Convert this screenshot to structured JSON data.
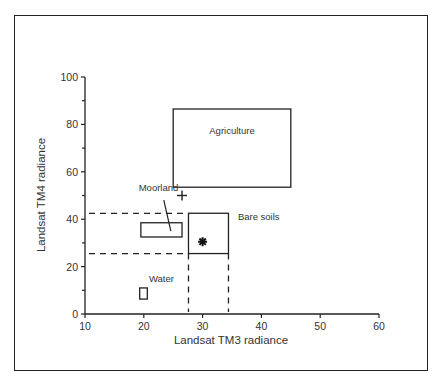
{
  "chart_data": {
    "type": "scatter",
    "title": "",
    "xlabel": "Landsat TM3 radiance",
    "ylabel": "Landsat TM4 radiance",
    "xlim": [
      10,
      60
    ],
    "ylim": [
      0,
      100
    ],
    "x_ticks": [
      10,
      20,
      30,
      40,
      50,
      60
    ],
    "y_ticks": [
      0,
      20,
      40,
      60,
      80,
      100
    ],
    "y_minor_ticks": [
      10,
      30,
      50,
      70,
      90
    ],
    "grid": false,
    "legend": null,
    "regions": [
      {
        "name": "Agriculture",
        "x": [
          25,
          45
        ],
        "y": [
          53.5,
          86.5
        ],
        "label_pos": [
          35,
          76
        ]
      },
      {
        "name": "Moorland",
        "x": [
          19.5,
          26.5
        ],
        "y": [
          32.5,
          38.5
        ],
        "label_pos": [
          22.5,
          52
        ],
        "leader_from": [
          23.4,
          48
        ],
        "leader_to": [
          24.6,
          35
        ]
      },
      {
        "name": "Bare soils",
        "x": [
          27.6,
          34.4
        ],
        "y": [
          25.5,
          42.5
        ],
        "label_pos": [
          36,
          39.5
        ]
      },
      {
        "name": "Water",
        "x": [
          19.3,
          20.6
        ],
        "y": [
          6.3,
          11
        ],
        "label_pos": [
          23,
          13.5
        ]
      }
    ],
    "points": [
      {
        "marker": "plus",
        "x": 26.5,
        "y": 50
      },
      {
        "marker": "asterisk",
        "x": 30,
        "y": 30.5
      }
    ],
    "dashed_guides": {
      "horizontal_y": [
        42.5,
        25.5
      ],
      "horizontal_x_range": [
        10,
        27.6
      ],
      "vertical_x": [
        27.6,
        34.4
      ],
      "vertical_y_range": [
        0,
        25.5
      ]
    }
  }
}
